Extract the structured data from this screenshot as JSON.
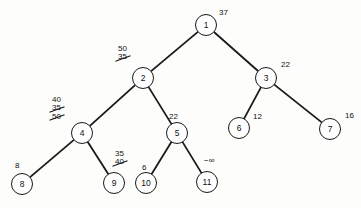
{
  "figure": {
    "type": "binary-tree-diagram",
    "width": 361,
    "height": 208,
    "background": "#fdfdfc",
    "stroke_color": "#1a1a1a",
    "text_color": "#111111"
  },
  "nodes": [
    {
      "id": "1",
      "label": "1",
      "cx": 206,
      "cy": 25,
      "r": 11
    },
    {
      "id": "2",
      "label": "2",
      "cx": 143,
      "cy": 78,
      "r": 11
    },
    {
      "id": "3",
      "label": "3",
      "cx": 266,
      "cy": 78,
      "r": 11
    },
    {
      "id": "4",
      "label": "4",
      "cx": 82,
      "cy": 133,
      "r": 11
    },
    {
      "id": "5",
      "label": "5",
      "cx": 177,
      "cy": 133,
      "r": 11
    },
    {
      "id": "6",
      "label": "6",
      "cx": 239,
      "cy": 128,
      "r": 11
    },
    {
      "id": "7",
      "label": "7",
      "cx": 330,
      "cy": 129,
      "r": 11
    },
    {
      "id": "8",
      "label": "8",
      "cx": 22,
      "cy": 184,
      "r": 11
    },
    {
      "id": "9",
      "label": "9",
      "cx": 114,
      "cy": 183,
      "r": 11
    },
    {
      "id": "10",
      "label": "10",
      "cx": 146,
      "cy": 183,
      "r": 11
    },
    {
      "id": "11",
      "label": "11",
      "cx": 207,
      "cy": 182,
      "r": 11
    }
  ],
  "edges": [
    {
      "from": "1",
      "to": "2"
    },
    {
      "from": "1",
      "to": "3"
    },
    {
      "from": "2",
      "to": "4"
    },
    {
      "from": "2",
      "to": "5"
    },
    {
      "from": "3",
      "to": "6"
    },
    {
      "from": "3",
      "to": "7"
    },
    {
      "from": "4",
      "to": "8"
    },
    {
      "from": "4",
      "to": "9"
    },
    {
      "from": "5",
      "to": "10"
    },
    {
      "from": "5",
      "to": "11"
    }
  ],
  "annotations": [
    {
      "node": "1",
      "x": 218,
      "y": 9,
      "align": "left",
      "values": [
        {
          "text": "37",
          "struck": false
        }
      ]
    },
    {
      "node": "2",
      "x": 117,
      "y": 45,
      "align": "left",
      "values": [
        {
          "text": "50",
          "struck": false
        },
        {
          "text": "35",
          "struck": true
        }
      ]
    },
    {
      "node": "3",
      "x": 280,
      "y": 61,
      "align": "left",
      "values": [
        {
          "text": "22",
          "struck": false
        }
      ]
    },
    {
      "node": "4",
      "x": 51,
      "y": 96,
      "align": "left",
      "values": [
        {
          "text": "40",
          "struck": false
        },
        {
          "text": "35",
          "struck": true
        },
        {
          "text": "50",
          "struck": true
        }
      ]
    },
    {
      "node": "5",
      "x": 168,
      "y": 113,
      "align": "left",
      "values": [
        {
          "text": "22",
          "struck": false
        }
      ]
    },
    {
      "node": "6",
      "x": 252,
      "y": 113,
      "align": "left",
      "values": [
        {
          "text": "12",
          "struck": false
        }
      ]
    },
    {
      "node": "7",
      "x": 344,
      "y": 112,
      "align": "left",
      "values": [
        {
          "text": "16",
          "struck": false
        }
      ]
    },
    {
      "node": "8",
      "x": 14,
      "y": 162,
      "align": "left",
      "values": [
        {
          "text": "8",
          "struck": false
        }
      ]
    },
    {
      "node": "9",
      "x": 114,
      "y": 150,
      "align": "left",
      "values": [
        {
          "text": "35",
          "struck": false
        },
        {
          "text": "40",
          "struck": true
        }
      ]
    },
    {
      "node": "10",
      "x": 141,
      "y": 164,
      "align": "left",
      "values": [
        {
          "text": "6",
          "struck": false
        }
      ]
    },
    {
      "node": "11",
      "x": 203,
      "y": 157,
      "align": "left",
      "values": [
        {
          "text": "−∞",
          "struck": false
        }
      ]
    }
  ]
}
